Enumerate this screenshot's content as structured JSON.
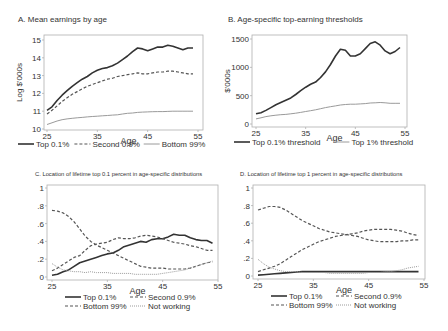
{
  "chart_data": [
    {
      "panel": "A",
      "type": "line",
      "title": "A. Mean earnings by age",
      "xlabel": "Age",
      "ylabel": "Log $'000s",
      "xlim": [
        25,
        55
      ],
      "ylim": [
        10,
        15
      ],
      "xticks": [
        25,
        35,
        45,
        55
      ],
      "yticks": [
        10,
        11,
        12,
        13,
        14,
        15
      ],
      "ytick_labels": [
        "10",
        "11",
        "12",
        "13",
        "14",
        "15"
      ],
      "grid": false,
      "legend": [
        "Top 0.1%",
        "Second 0.9%",
        "Bottom 99%"
      ],
      "legend_position": "bottom",
      "x": [
        25,
        26,
        27,
        28,
        29,
        30,
        31,
        32,
        33,
        34,
        35,
        36,
        37,
        38,
        39,
        40,
        41,
        42,
        43,
        44,
        45,
        46,
        47,
        48,
        49,
        50,
        51,
        52,
        53,
        54
      ],
      "series": [
        {
          "name": "Top 0.1%",
          "style": "solid-thick",
          "values": [
            11.05,
            11.25,
            11.6,
            11.9,
            12.15,
            12.4,
            12.6,
            12.8,
            12.95,
            13.15,
            13.3,
            13.4,
            13.45,
            13.55,
            13.7,
            13.9,
            14.1,
            14.35,
            14.55,
            14.5,
            14.4,
            14.5,
            14.6,
            14.6,
            14.7,
            14.65,
            14.55,
            14.45,
            14.55,
            14.55
          ]
        },
        {
          "name": "Second 0.9%",
          "style": "dashed",
          "values": [
            10.85,
            11.05,
            11.3,
            11.55,
            11.75,
            11.95,
            12.1,
            12.25,
            12.4,
            12.5,
            12.6,
            12.7,
            12.8,
            12.85,
            12.95,
            13.0,
            13.05,
            13.1,
            13.15,
            13.1,
            13.1,
            13.15,
            13.2,
            13.2,
            13.25,
            13.25,
            13.2,
            13.15,
            13.1,
            13.1
          ]
        },
        {
          "name": "Bottom 99%",
          "style": "solid-thin",
          "values": [
            10.25,
            10.35,
            10.45,
            10.52,
            10.57,
            10.6,
            10.63,
            10.65,
            10.68,
            10.7,
            10.72,
            10.74,
            10.76,
            10.78,
            10.8,
            10.84,
            10.88,
            10.9,
            10.93,
            10.95,
            10.96,
            10.97,
            10.98,
            10.98,
            10.99,
            11.0,
            11.0,
            11.0,
            11.0,
            11.0
          ]
        }
      ]
    },
    {
      "panel": "B",
      "type": "line",
      "title": "B. Age-specific top-earning thresholds",
      "xlabel": "Age",
      "ylabel": "$'000s",
      "xlim": [
        25,
        55
      ],
      "ylim": [
        0,
        1500
      ],
      "xticks": [
        25,
        35,
        45,
        55
      ],
      "yticks": [
        0,
        500,
        1000,
        1500
      ],
      "ytick_labels": [
        "0",
        "500",
        "1000",
        "1500"
      ],
      "grid": false,
      "legend": [
        "Top 0.1% threshold",
        "Top 1% threshold"
      ],
      "legend_position": "bottom",
      "x": [
        25,
        26,
        27,
        28,
        29,
        30,
        31,
        32,
        33,
        34,
        35,
        36,
        37,
        38,
        39,
        40,
        41,
        42,
        43,
        44,
        45,
        46,
        47,
        48,
        49,
        50,
        51,
        52,
        53,
        54
      ],
      "series": [
        {
          "name": "Top 0.1% threshold",
          "style": "solid-thick",
          "values": [
            180,
            200,
            240,
            290,
            340,
            380,
            420,
            460,
            520,
            590,
            650,
            700,
            740,
            820,
            920,
            1050,
            1200,
            1320,
            1300,
            1200,
            1200,
            1240,
            1330,
            1420,
            1450,
            1390,
            1290,
            1240,
            1280,
            1350
          ]
        },
        {
          "name": "Top 1% threshold",
          "style": "solid-thin",
          "values": [
            90,
            110,
            130,
            145,
            155,
            165,
            170,
            180,
            190,
            205,
            220,
            235,
            250,
            270,
            290,
            305,
            320,
            335,
            345,
            350,
            350,
            355,
            360,
            370,
            375,
            380,
            375,
            365,
            365,
            365
          ]
        }
      ]
    },
    {
      "panel": "C",
      "type": "line",
      "title": "C. Location of lifetime top 0.1 percent in age-specific distributions",
      "xlabel": "Age",
      "ylabel": "",
      "xlim": [
        25,
        55
      ],
      "ylim": [
        0,
        1
      ],
      "xticks": [
        25,
        35,
        45,
        55
      ],
      "yticks": [
        0,
        0.2,
        0.4,
        0.6,
        0.8,
        1
      ],
      "ytick_labels": [
        "0",
        ".2",
        ".4",
        ".6",
        ".8",
        "1"
      ],
      "grid": false,
      "legend": [
        "Top 0.1%",
        "Second 0.9%",
        "Bottom 99%",
        "Not working"
      ],
      "legend_position": "bottom",
      "x": [
        25,
        26,
        27,
        28,
        29,
        30,
        31,
        32,
        33,
        34,
        35,
        36,
        37,
        38,
        39,
        40,
        41,
        42,
        43,
        44,
        45,
        46,
        47,
        48,
        49,
        50,
        51,
        52,
        53,
        54
      ],
      "series": [
        {
          "name": "Top 0.1%",
          "style": "solid-thick",
          "values": [
            0.02,
            0.03,
            0.06,
            0.08,
            0.12,
            0.16,
            0.18,
            0.2,
            0.22,
            0.24,
            0.26,
            0.27,
            0.3,
            0.34,
            0.36,
            0.38,
            0.4,
            0.39,
            0.42,
            0.43,
            0.43,
            0.45,
            0.48,
            0.47,
            0.47,
            0.44,
            0.42,
            0.41,
            0.41,
            0.38
          ]
        },
        {
          "name": "Second 0.9%",
          "style": "dashed",
          "values": [
            0.07,
            0.1,
            0.14,
            0.18,
            0.22,
            0.24,
            0.3,
            0.35,
            0.37,
            0.38,
            0.39,
            0.42,
            0.44,
            0.43,
            0.43,
            0.44,
            0.46,
            0.47,
            0.46,
            0.45,
            0.43,
            0.41,
            0.39,
            0.38,
            0.37,
            0.35,
            0.34,
            0.32,
            0.3,
            0.3
          ]
        },
        {
          "name": "Bottom 99%",
          "style": "dashed",
          "values": [
            0.75,
            0.74,
            0.72,
            0.68,
            0.62,
            0.54,
            0.46,
            0.4,
            0.36,
            0.33,
            0.3,
            0.27,
            0.24,
            0.21,
            0.18,
            0.15,
            0.12,
            0.11,
            0.1,
            0.1,
            0.1,
            0.09,
            0.09,
            0.09,
            0.09,
            0.1,
            0.12,
            0.14,
            0.16,
            0.17
          ]
        },
        {
          "name": "Not working",
          "style": "dotted",
          "values": [
            0.15,
            0.11,
            0.08,
            0.07,
            0.06,
            0.06,
            0.05,
            0.06,
            0.05,
            0.05,
            0.05,
            0.04,
            0.04,
            0.04,
            0.04,
            0.03,
            0.03,
            0.03,
            0.03,
            0.03,
            0.04,
            0.05,
            0.06,
            0.07,
            0.08,
            0.1,
            0.12,
            0.14,
            0.16,
            0.18
          ]
        }
      ]
    },
    {
      "panel": "D",
      "type": "line",
      "title": "D. Location of lifetime top 1 percent in age-specific distributions",
      "xlabel": "Age",
      "ylabel": "",
      "xlim": [
        25,
        55
      ],
      "ylim": [
        0,
        1
      ],
      "xticks": [
        25,
        35,
        45,
        55
      ],
      "yticks": [
        0,
        0.2,
        0.4,
        0.6,
        0.8,
        1
      ],
      "ytick_labels": [
        "0",
        ".2",
        ".4",
        ".6",
        ".8",
        "1"
      ],
      "grid": false,
      "legend": [
        "Top 0.1%",
        "Second 0.9%",
        "Bottom 99%",
        "Not working"
      ],
      "legend_position": "bottom",
      "x": [
        25,
        26,
        27,
        28,
        29,
        30,
        31,
        32,
        33,
        34,
        35,
        36,
        37,
        38,
        39,
        40,
        41,
        42,
        43,
        44,
        45,
        46,
        47,
        48,
        49,
        50,
        51,
        52,
        53,
        54
      ],
      "series": [
        {
          "name": "Top 0.1%",
          "style": "solid-thick",
          "values": [
            0.01,
            0.015,
            0.02,
            0.025,
            0.03,
            0.035,
            0.04,
            0.045,
            0.05,
            0.05,
            0.05,
            0.05,
            0.05,
            0.05,
            0.05,
            0.05,
            0.05,
            0.05,
            0.05,
            0.05,
            0.05,
            0.05,
            0.05,
            0.05,
            0.05,
            0.05,
            0.05,
            0.05,
            0.05,
            0.05
          ]
        },
        {
          "name": "Second 0.9%",
          "style": "dashed",
          "values": [
            0.05,
            0.07,
            0.09,
            0.11,
            0.14,
            0.18,
            0.22,
            0.26,
            0.3,
            0.33,
            0.36,
            0.39,
            0.41,
            0.43,
            0.45,
            0.46,
            0.47,
            0.48,
            0.49,
            0.51,
            0.52,
            0.53,
            0.53,
            0.53,
            0.53,
            0.52,
            0.51,
            0.49,
            0.47,
            0.46
          ]
        },
        {
          "name": "Bottom 99%",
          "style": "dashed",
          "values": [
            0.75,
            0.77,
            0.79,
            0.79,
            0.78,
            0.75,
            0.71,
            0.67,
            0.63,
            0.6,
            0.57,
            0.54,
            0.52,
            0.5,
            0.49,
            0.48,
            0.47,
            0.46,
            0.45,
            0.43,
            0.41,
            0.4,
            0.39,
            0.39,
            0.39,
            0.39,
            0.4,
            0.4,
            0.41,
            0.41
          ]
        },
        {
          "name": "Not working",
          "style": "dotted",
          "values": [
            0.19,
            0.14,
            0.1,
            0.08,
            0.06,
            0.05,
            0.05,
            0.05,
            0.04,
            0.04,
            0.04,
            0.04,
            0.04,
            0.03,
            0.03,
            0.03,
            0.03,
            0.03,
            0.03,
            0.03,
            0.04,
            0.04,
            0.04,
            0.05,
            0.05,
            0.06,
            0.07,
            0.09,
            0.1,
            0.11
          ]
        }
      ]
    }
  ],
  "layout": {
    "panels": [
      {
        "id": "A",
        "box": [
          44,
          35,
          203,
          130
        ],
        "xrange": [
          47,
          198
        ],
        "yrange": [
          129,
          40
        ],
        "title_pos": [
          18,
          22
        ],
        "legend_y": 147
      },
      {
        "id": "B",
        "box": [
          252,
          35,
          407,
          127
        ],
        "xrange": [
          256,
          405
        ],
        "yrange": [
          124,
          39
        ],
        "title_pos": [
          228,
          22
        ],
        "legend_y": 145
      },
      {
        "id": "C",
        "box": [
          47,
          185,
          218,
          280
        ],
        "xrange": [
          52,
          218
        ],
        "yrange": [
          277,
          188
        ],
        "title_pos": [
          35,
          176
        ],
        "legend_y": 300
      },
      {
        "id": "D",
        "box": [
          253,
          185,
          425,
          279
        ],
        "xrange": [
          258,
          424
        ],
        "yrange": [
          276,
          188
        ],
        "title_pos": [
          240,
          176
        ],
        "legend_y": 299
      }
    ],
    "colors": {
      "axis": "#b0b0b0",
      "text": "#333333",
      "dark": "#333333",
      "mid": "#555555",
      "light": "#9a9a9a"
    }
  }
}
